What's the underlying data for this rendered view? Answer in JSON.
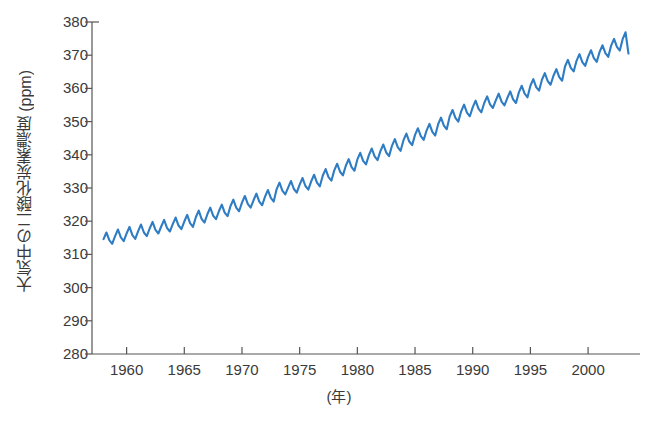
{
  "chart_data": {
    "type": "line",
    "title": "",
    "subtitle": "",
    "ylabel": "大気中の二酸化炭素濃度 (ppm)",
    "xlabel": "(年)",
    "xlim": [
      1957.0,
      2004.5
    ],
    "ylim": [
      280,
      380
    ],
    "grid": false,
    "legend": null,
    "series_color": "#2e7cc4",
    "xticks": [
      1960,
      1965,
      1970,
      1975,
      1980,
      1985,
      1990,
      1995,
      2000
    ],
    "xtick_labels": [
      "1960",
      "1965",
      "1970",
      "1975",
      "1980",
      "1985",
      "1990",
      "1995",
      "2000"
    ],
    "yticks": [
      280,
      290,
      300,
      310,
      320,
      330,
      340,
      350,
      360,
      370,
      380
    ],
    "ytick_labels": [
      "280",
      "290",
      "300",
      "310",
      "320",
      "330",
      "340",
      "350",
      "360",
      "370",
      "380"
    ],
    "annotations": [],
    "series": [
      {
        "name": "Atmospheric CO2 concentration",
        "x": [
          1958.0,
          1958.25,
          1958.5,
          1958.75,
          1959.0,
          1959.25,
          1959.5,
          1959.75,
          1960.0,
          1960.25,
          1960.5,
          1960.75,
          1961.0,
          1961.25,
          1961.5,
          1961.75,
          1962.0,
          1962.25,
          1962.5,
          1962.75,
          1963.0,
          1963.25,
          1963.5,
          1963.75,
          1964.0,
          1964.25,
          1964.5,
          1964.75,
          1965.0,
          1965.25,
          1965.5,
          1965.75,
          1966.0,
          1966.25,
          1966.5,
          1966.75,
          1967.0,
          1967.25,
          1967.5,
          1967.75,
          1968.0,
          1968.25,
          1968.5,
          1968.75,
          1969.0,
          1969.25,
          1969.5,
          1969.75,
          1970.0,
          1970.25,
          1970.5,
          1970.75,
          1971.0,
          1971.25,
          1971.5,
          1971.75,
          1972.0,
          1972.25,
          1972.5,
          1972.75,
          1973.0,
          1973.25,
          1973.5,
          1973.75,
          1974.0,
          1974.25,
          1974.5,
          1974.75,
          1975.0,
          1975.25,
          1975.5,
          1975.75,
          1976.0,
          1976.25,
          1976.5,
          1976.75,
          1977.0,
          1977.25,
          1977.5,
          1977.75,
          1978.0,
          1978.25,
          1978.5,
          1978.75,
          1979.0,
          1979.25,
          1979.5,
          1979.75,
          1980.0,
          1980.25,
          1980.5,
          1980.75,
          1981.0,
          1981.25,
          1981.5,
          1981.75,
          1982.0,
          1982.25,
          1982.5,
          1982.75,
          1983.0,
          1983.25,
          1983.5,
          1983.75,
          1984.0,
          1984.25,
          1984.5,
          1984.75,
          1985.0,
          1985.25,
          1985.5,
          1985.75,
          1986.0,
          1986.25,
          1986.5,
          1986.75,
          1987.0,
          1987.25,
          1987.5,
          1987.75,
          1988.0,
          1988.25,
          1988.5,
          1988.75,
          1989.0,
          1989.25,
          1989.5,
          1989.75,
          1990.0,
          1990.25,
          1990.5,
          1990.75,
          1991.0,
          1991.25,
          1991.5,
          1991.75,
          1992.0,
          1992.25,
          1992.5,
          1992.75,
          1993.0,
          1993.25,
          1993.5,
          1993.75,
          1994.0,
          1994.25,
          1994.5,
          1994.75,
          1995.0,
          1995.25,
          1995.5,
          1995.75,
          1996.0,
          1996.25,
          1996.5,
          1996.75,
          1997.0,
          1997.25,
          1997.5,
          1997.75,
          1998.0,
          1998.25,
          1998.5,
          1998.75,
          1999.0,
          1999.25,
          1999.5,
          1999.75,
          2000.0,
          2000.25,
          2000.5,
          2000.75,
          2001.0,
          2001.25,
          2001.5,
          2001.75,
          2002.0,
          2002.25,
          2002.5,
          2002.75,
          2003.0,
          2003.25,
          2003.5
        ],
        "y": [
          314.6,
          316.6,
          314.3,
          313.2,
          315.5,
          317.5,
          315.1,
          314.0,
          316.3,
          318.3,
          315.8,
          314.7,
          317.0,
          319.0,
          316.6,
          315.5,
          317.8,
          319.8,
          317.4,
          316.3,
          318.4,
          320.4,
          318.0,
          316.9,
          319.1,
          321.1,
          318.7,
          317.6,
          319.9,
          321.9,
          319.4,
          318.3,
          321.2,
          323.2,
          320.7,
          319.6,
          322.1,
          324.1,
          321.7,
          320.6,
          323.0,
          325.0,
          322.6,
          321.5,
          324.5,
          326.5,
          324.1,
          323.0,
          325.6,
          327.6,
          325.2,
          324.1,
          326.3,
          328.3,
          325.9,
          324.8,
          327.4,
          329.4,
          327.0,
          325.9,
          329.6,
          331.6,
          329.2,
          328.1,
          330.1,
          332.1,
          329.7,
          328.6,
          331.0,
          333.0,
          330.6,
          329.5,
          332.0,
          334.0,
          331.6,
          330.5,
          333.7,
          335.7,
          333.3,
          332.2,
          335.3,
          337.3,
          334.9,
          333.8,
          336.7,
          338.7,
          336.3,
          335.2,
          338.6,
          340.6,
          338.2,
          337.1,
          339.9,
          341.9,
          339.5,
          338.4,
          341.1,
          343.1,
          340.7,
          339.6,
          342.7,
          344.7,
          342.3,
          341.2,
          344.4,
          346.4,
          344.0,
          342.9,
          346.0,
          348.0,
          345.6,
          344.5,
          347.3,
          349.3,
          346.9,
          345.8,
          349.2,
          351.2,
          348.8,
          347.7,
          351.5,
          353.5,
          351.1,
          350.0,
          353.1,
          355.1,
          352.7,
          351.6,
          354.3,
          356.3,
          353.9,
          352.8,
          355.6,
          357.6,
          355.2,
          354.1,
          356.4,
          358.4,
          356.0,
          354.9,
          357.1,
          359.1,
          356.7,
          355.6,
          358.8,
          360.8,
          358.4,
          357.3,
          360.8,
          362.8,
          360.4,
          359.3,
          362.6,
          364.6,
          362.2,
          361.1,
          363.8,
          365.8,
          363.4,
          362.3,
          366.6,
          368.6,
          366.2,
          365.1,
          368.3,
          370.3,
          367.9,
          366.8,
          369.5,
          371.5,
          369.1,
          368.0,
          371.0,
          373.0,
          370.6,
          369.5,
          372.9,
          374.9,
          372.5,
          371.4,
          374.9,
          376.9,
          370.5
        ]
      }
    ]
  }
}
